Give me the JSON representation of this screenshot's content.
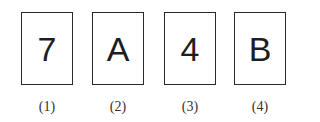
{
  "cards": [
    {
      "symbol": "7",
      "label": "(1)"
    },
    {
      "symbol": "A",
      "label": "(2)"
    },
    {
      "symbol": "4",
      "label": "(3)"
    },
    {
      "symbol": "B",
      "label": "(4)"
    }
  ],
  "colors": {
    "border": "#2a2a2a",
    "text": "#1e1e1e",
    "background": "#ffffff"
  }
}
